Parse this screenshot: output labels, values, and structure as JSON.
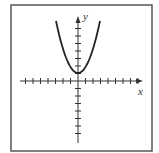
{
  "figure": {
    "type": "parabola-graph",
    "axis_labels": {
      "x": "x",
      "y": "y"
    },
    "colors": {
      "frame": "#555555",
      "axis": "#333333",
      "curve": "#222222"
    },
    "x_ticks_left": 7,
    "x_ticks_right": 8,
    "y_ticks_up": 7,
    "y_ticks_down": 7,
    "curve": {
      "shape": "upward parabola",
      "vertex": [
        0,
        1
      ]
    }
  }
}
